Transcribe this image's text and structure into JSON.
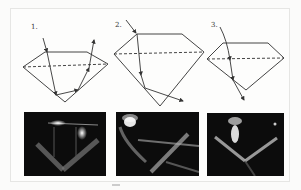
{
  "figure": {
    "panels": [
      {
        "label": "1.",
        "description": "Well-cut diamond: light enters table, reflects off both pavilion facets, exits through top"
      },
      {
        "label": "2.",
        "description": "Deep-cut diamond: light leaks out through the pavilion side"
      },
      {
        "label": "3.",
        "description": "Shallow-cut diamond: light passes straight out through the bottom"
      }
    ],
    "photos": [
      {
        "name": "photo-ideal-cut"
      },
      {
        "name": "photo-deep-cut"
      },
      {
        "name": "photo-shallow-cut"
      }
    ],
    "colors": {
      "line": "#333333",
      "photo_bg": "#0c0c0c",
      "light": "#ffffff"
    }
  }
}
